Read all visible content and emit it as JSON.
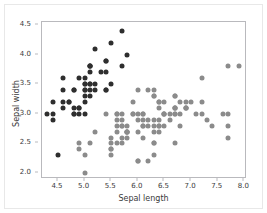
{
  "chart_data": {
    "type": "scatter",
    "title": "",
    "xlabel": "Sepal length",
    "ylabel": "Sepal width",
    "xlim": [
      4.2,
      8.05
    ],
    "ylim": [
      1.9,
      4.55
    ],
    "xticks": [
      4.5,
      5.0,
      5.5,
      6.0,
      6.5,
      7.0,
      7.5,
      8.0
    ],
    "xtick_labels": [
      "4.5",
      "5.0",
      "5.5",
      "6.0",
      "6.5",
      "7.0",
      "7.5",
      "8.0"
    ],
    "yticks": [
      2.0,
      2.5,
      3.0,
      3.5,
      4.0,
      4.5
    ],
    "ytick_labels": [
      "2.0",
      "2.5",
      "3.0",
      "3.5",
      "4.0",
      "4.5"
    ],
    "grid": false,
    "legend": false,
    "marker_size_px": 5,
    "series": [
      {
        "name": "setosa",
        "color": "#2e2e2e",
        "x": [
          5.1,
          4.9,
          4.7,
          4.6,
          5.0,
          5.4,
          4.6,
          5.0,
          4.4,
          4.9,
          5.4,
          4.8,
          4.8,
          4.3,
          5.8,
          5.7,
          5.4,
          5.1,
          5.7,
          5.1,
          5.4,
          5.1,
          4.6,
          5.1,
          4.8,
          5.0,
          5.0,
          5.2,
          5.2,
          4.7,
          4.8,
          5.4,
          5.2,
          5.5,
          4.9,
          5.0,
          5.5,
          4.9,
          4.4,
          5.1,
          5.0,
          4.5,
          4.4,
          5.0,
          5.1,
          4.8,
          5.1,
          4.6,
          5.3,
          5.0
        ],
        "y": [
          3.5,
          3.0,
          3.2,
          3.1,
          3.6,
          3.9,
          3.4,
          3.4,
          2.9,
          3.1,
          3.7,
          3.4,
          3.0,
          3.0,
          4.0,
          4.4,
          3.9,
          3.5,
          3.8,
          3.8,
          3.4,
          3.7,
          3.6,
          3.3,
          3.4,
          3.0,
          3.4,
          3.5,
          3.4,
          3.2,
          3.1,
          3.4,
          4.1,
          4.2,
          3.1,
          3.2,
          3.5,
          3.6,
          3.0,
          3.4,
          3.5,
          2.3,
          3.2,
          3.5,
          3.8,
          3.0,
          3.8,
          3.2,
          3.7,
          3.3
        ]
      },
      {
        "name": "versicolor-virginica",
        "color": "#8b8b8b",
        "x": [
          7.0,
          6.4,
          6.9,
          5.5,
          6.5,
          5.7,
          6.3,
          4.9,
          6.6,
          5.2,
          5.0,
          5.9,
          6.0,
          6.1,
          5.6,
          6.7,
          5.6,
          5.8,
          6.2,
          5.6,
          5.9,
          6.1,
          6.3,
          6.1,
          6.4,
          6.6,
          6.8,
          6.7,
          6.0,
          5.7,
          5.5,
          5.5,
          5.8,
          6.0,
          5.4,
          6.0,
          6.7,
          6.3,
          5.6,
          5.5,
          5.5,
          6.1,
          5.8,
          5.0,
          5.6,
          5.7,
          5.7,
          6.2,
          5.1,
          5.7,
          6.3,
          5.8,
          7.1,
          6.3,
          6.5,
          7.6,
          4.9,
          7.3,
          6.7,
          7.2,
          6.5,
          6.4,
          6.8,
          5.7,
          5.8,
          6.4,
          6.5,
          7.7,
          7.7,
          6.0,
          6.9,
          5.6,
          7.7,
          6.3,
          6.7,
          7.2,
          6.2,
          6.1,
          6.4,
          7.2,
          7.4,
          7.9,
          6.4,
          6.3,
          6.1,
          7.7,
          6.3,
          6.4,
          6.0,
          6.9,
          6.7,
          6.9,
          5.8,
          6.8,
          6.7,
          6.7,
          6.3,
          6.5,
          6.2,
          5.9
        ],
        "y": [
          3.2,
          3.2,
          3.1,
          2.3,
          2.8,
          2.8,
          3.3,
          2.4,
          2.9,
          2.7,
          2.0,
          3.0,
          2.2,
          2.9,
          2.9,
          3.1,
          3.0,
          2.7,
          2.2,
          2.5,
          3.2,
          2.8,
          2.5,
          2.8,
          2.9,
          3.0,
          2.8,
          3.0,
          2.9,
          2.6,
          2.4,
          2.4,
          2.7,
          2.7,
          3.0,
          3.4,
          3.1,
          2.3,
          3.0,
          2.5,
          2.6,
          3.0,
          2.6,
          2.3,
          2.7,
          3.0,
          2.9,
          2.9,
          2.5,
          2.8,
          3.3,
          2.7,
          3.0,
          2.9,
          3.0,
          3.0,
          2.5,
          2.9,
          2.5,
          3.6,
          3.2,
          2.7,
          3.0,
          2.5,
          2.8,
          3.2,
          3.0,
          3.8,
          2.6,
          2.2,
          3.2,
          2.8,
          2.8,
          2.7,
          3.3,
          3.2,
          2.8,
          3.0,
          2.8,
          3.0,
          2.8,
          3.8,
          2.8,
          2.8,
          2.6,
          3.0,
          3.4,
          3.1,
          3.0,
          3.1,
          3.1,
          3.1,
          2.7,
          3.2,
          3.3,
          3.0,
          2.5,
          3.0,
          3.4,
          3.0
        ]
      }
    ]
  }
}
